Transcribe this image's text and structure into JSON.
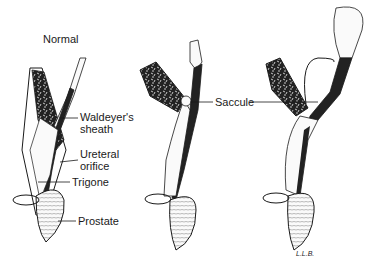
{
  "title": "Normal",
  "panels": [
    {
      "id": "normal",
      "caption": "Normal"
    },
    {
      "id": "stage2",
      "caption": ""
    },
    {
      "id": "stage3",
      "caption": ""
    }
  ],
  "labels": {
    "waldeyer_line1": "Waldeyer's",
    "waldeyer_line2": "sheath",
    "ureteral_line1": "Ureteral",
    "ureteral_line2": "orifice",
    "trigone": "Trigone",
    "prostate": "Prostate",
    "saccule": "Saccule"
  },
  "signature": "L.L.B.",
  "colors": {
    "ink": "#1a1a1a",
    "background": "#ffffff",
    "fill_dark": "#222222",
    "fill_light": "#f4f4f4"
  }
}
